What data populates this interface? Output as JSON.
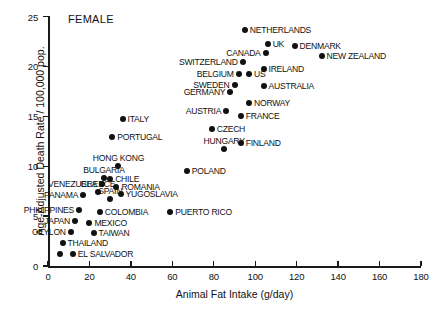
{
  "chart_data": {
    "type": "scatter",
    "title": "",
    "panel_label": "FEMALE",
    "xlabel": "Animal Fat Intake (g/day)",
    "ylabel": "Age-Adjusted Death Rate / 100,000 pop.",
    "xlim": [
      0,
      180
    ],
    "ylim": [
      0,
      25
    ],
    "xticks": [
      0,
      20,
      40,
      60,
      80,
      100,
      120,
      140,
      160,
      180
    ],
    "yticks": [
      0,
      5,
      10,
      15,
      20,
      25
    ],
    "grid": false,
    "legend": false,
    "marker_color": "#111111",
    "points": [
      {
        "label": "NETHERLANDS",
        "x": 95,
        "y": 23.6,
        "pos": "r"
      },
      {
        "label": "UK",
        "x": 106,
        "y": 22.2,
        "pos": "r"
      },
      {
        "label": "DENMARK",
        "x": 119,
        "y": 22.0,
        "pos": "r"
      },
      {
        "label": "CANADA",
        "x": 105,
        "y": 21.3,
        "pos": "l"
      },
      {
        "label": "NEW ZEALAND",
        "x": 132,
        "y": 21.0,
        "pos": "r"
      },
      {
        "label": "SWITZERLAND",
        "x": 94,
        "y": 20.4,
        "pos": "l"
      },
      {
        "label": "IRELAND",
        "x": 104,
        "y": 19.7,
        "pos": "r"
      },
      {
        "label": "BELGIUM",
        "x": 92,
        "y": 19.2,
        "pos": "l"
      },
      {
        "label": "US",
        "x": 97,
        "y": 19.2,
        "pos": "r"
      },
      {
        "label": "AUSTRALIA",
        "x": 104,
        "y": 18.0,
        "pos": "r"
      },
      {
        "label": "SWEDEN",
        "x": 90,
        "y": 18.1,
        "pos": "l"
      },
      {
        "label": "GERMANY",
        "x": 88,
        "y": 17.4,
        "pos": "l"
      },
      {
        "label": "NORWAY",
        "x": 97,
        "y": 16.3,
        "pos": "r"
      },
      {
        "label": "AUSTRIA",
        "x": 86,
        "y": 15.5,
        "pos": "l"
      },
      {
        "label": "FRANCE",
        "x": 93,
        "y": 15.0,
        "pos": "r"
      },
      {
        "label": "ITALY",
        "x": 36,
        "y": 14.7,
        "pos": "r"
      },
      {
        "label": "CZECH",
        "x": 79,
        "y": 13.7,
        "pos": "r"
      },
      {
        "label": "FINLAND",
        "x": 93,
        "y": 12.3,
        "pos": "r"
      },
      {
        "label": "PORTUGAL",
        "x": 31,
        "y": 12.9,
        "pos": "r"
      },
      {
        "label": "HUNGARY",
        "x": 85,
        "y": 11.7,
        "pos": "c"
      },
      {
        "label": "HONG KONG",
        "x": 34,
        "y": 10.0,
        "pos": "c"
      },
      {
        "label": "POLAND",
        "x": 67,
        "y": 9.5,
        "pos": "r"
      },
      {
        "label": "BULGARIA",
        "x": 27,
        "y": 8.8,
        "pos": "c"
      },
      {
        "label": "CHILE",
        "x": 30,
        "y": 8.7,
        "pos": "r"
      },
      {
        "label": "VENEZUELA",
        "x": 26,
        "y": 8.2,
        "pos": "l"
      },
      {
        "label": "ROMANIA",
        "x": 33,
        "y": 7.9,
        "pos": "r"
      },
      {
        "label": "GREECE",
        "x": 24,
        "y": 7.4,
        "pos": "c"
      },
      {
        "label": "YUGOSLAVIA",
        "x": 35,
        "y": 7.2,
        "pos": "r"
      },
      {
        "label": "PANAMA",
        "x": 17,
        "y": 7.1,
        "pos": "l"
      },
      {
        "label": "SPAIN",
        "x": 30,
        "y": 6.7,
        "pos": "c"
      },
      {
        "label": "PHILIPPINES",
        "x": 15,
        "y": 5.6,
        "pos": "l"
      },
      {
        "label": "COLOMBIA",
        "x": 25,
        "y": 5.4,
        "pos": "r"
      },
      {
        "label": "PUERTO RICO",
        "x": 59,
        "y": 5.4,
        "pos": "r"
      },
      {
        "label": "JAPAN",
        "x": 13,
        "y": 4.5,
        "pos": "l"
      },
      {
        "label": "MEXICO",
        "x": 20,
        "y": 4.3,
        "pos": "r"
      },
      {
        "label": "CEYLON",
        "x": 11,
        "y": 3.4,
        "pos": "l"
      },
      {
        "label": "TAIWAN",
        "x": 22,
        "y": 3.3,
        "pos": "r"
      },
      {
        "label": "THAILAND",
        "x": 7,
        "y": 2.3,
        "pos": "r"
      },
      {
        "label": "EL SALVADOR",
        "x": 12,
        "y": 1.2,
        "pos": "r"
      },
      {
        "label": "",
        "x": 6,
        "y": 1.2,
        "pos": "r"
      }
    ]
  }
}
